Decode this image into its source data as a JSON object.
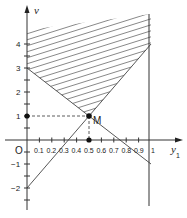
{
  "diagram": {
    "y_axis_label": "v",
    "x_axis_label": "y",
    "x_axis_label_subscript": "1",
    "origin_label": "O",
    "point_label": "M",
    "point_M": {
      "x": 0.5,
      "y": 1
    },
    "y_ticks": [
      {
        "value": 4,
        "label": "4"
      },
      {
        "value": 3,
        "label": "3"
      },
      {
        "value": 2,
        "label": "2"
      },
      {
        "value": 1,
        "label": "1"
      },
      {
        "value": -1,
        "label": "−1"
      },
      {
        "value": -2,
        "label": "−2"
      }
    ],
    "x_ticks": [
      {
        "value": 0.1,
        "label": "0.1"
      },
      {
        "value": 0.2,
        "label": "0.2"
      },
      {
        "value": 0.3,
        "label": "0.3"
      },
      {
        "value": 0.4,
        "label": "0.4"
      },
      {
        "value": 0.5,
        "label": "0.5"
      },
      {
        "value": 0.6,
        "label": "0.6"
      },
      {
        "value": 0.7,
        "label": "0.7"
      },
      {
        "value": 0.8,
        "label": "0.8"
      },
      {
        "value": 0.9,
        "label": "0.9"
      },
      {
        "value": 1,
        "label": "1"
      }
    ],
    "lines": [
      {
        "name": "line-from-0-3-to-1-minus1",
        "from": [
          0,
          3
        ],
        "to": [
          1,
          -1
        ]
      },
      {
        "name": "line-from-0-minus2-to-1-4",
        "from": [
          0,
          -2
        ],
        "to": [
          1,
          4
        ]
      },
      {
        "name": "vertical-line-x-1",
        "x": 1
      }
    ],
    "shaded_region": "feasible region above both lines, between v-axis and y1=1 (hatched)",
    "colors": {
      "ink": "#333333",
      "background": "#ffffff"
    }
  }
}
